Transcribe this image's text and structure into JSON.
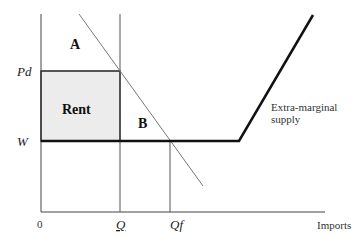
{
  "diagram": {
    "title": "",
    "axes": {
      "y_labels": {
        "pd": "Pd",
        "w": "W"
      },
      "x_labels": {
        "origin": "0",
        "q_under": "Q",
        "qf": "Qf",
        "x_axis_title": "Imports"
      }
    },
    "regions": {
      "a": "A",
      "rent": "Rent",
      "b": "B"
    },
    "annotations": {
      "extra_marginal_line1": "Extra-marginal",
      "extra_marginal_line2": "supply"
    },
    "colors": {
      "rent_fill": "#ececec",
      "axis": "#444444",
      "supply": "#111111",
      "demand": "#777777"
    }
  }
}
